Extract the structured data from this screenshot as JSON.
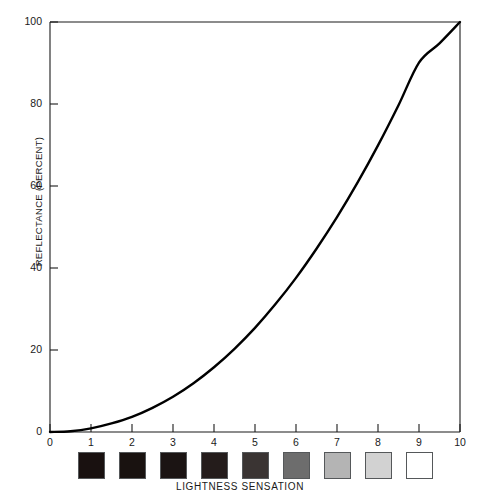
{
  "chart_data": {
    "type": "line",
    "title": "",
    "xlabel": "LIGHTNESS SENSATION",
    "ylabel": "REFLECTANCE (PERCENT)",
    "xlim": [
      0,
      10
    ],
    "ylim": [
      0,
      100
    ],
    "grid": false,
    "legend": null,
    "xticks": [
      "0",
      "1",
      "2",
      "3",
      "4",
      "5",
      "6",
      "7",
      "8",
      "9",
      "10"
    ],
    "yticks": [
      "0",
      "20",
      "40",
      "60",
      "80",
      "100"
    ],
    "x": [
      0,
      0.5,
      1,
      1.5,
      2,
      2.5,
      3,
      3.5,
      4,
      4.5,
      5,
      5.5,
      6,
      6.5,
      7,
      7.5,
      8,
      8.5,
      9,
      9.5,
      10
    ],
    "y": [
      0,
      0.2,
      0.9,
      2.1,
      3.7,
      5.9,
      8.6,
      11.9,
      15.8,
      20.3,
      25.4,
      31.2,
      37.6,
      44.7,
      52.4,
      60.8,
      69.9,
      79.7,
      90.1,
      94.8,
      100
    ],
    "series": [
      {
        "name": "reflectance",
        "values": [
          0,
          0.2,
          0.9,
          2.1,
          3.7,
          5.9,
          8.6,
          11.9,
          15.8,
          20.3,
          25.4,
          31.2,
          37.6,
          44.7,
          52.4,
          60.8,
          69.9,
          79.7,
          90.1,
          94.8,
          100
        ],
        "color": "#000000"
      }
    ],
    "swatches": [
      {
        "label": "1",
        "color": "#191110"
      },
      {
        "label": "2",
        "color": "#191210"
      },
      {
        "label": "3",
        "color": "#1b1413"
      },
      {
        "label": "4",
        "color": "#241c1b"
      },
      {
        "label": "5",
        "color": "#3a3433"
      },
      {
        "label": "6",
        "color": "#6d6d6d"
      },
      {
        "label": "7",
        "color": "#b4b4b4"
      },
      {
        "label": "8",
        "color": "#d2d2d2"
      },
      {
        "label": "9",
        "color": "#ffffff"
      }
    ]
  }
}
